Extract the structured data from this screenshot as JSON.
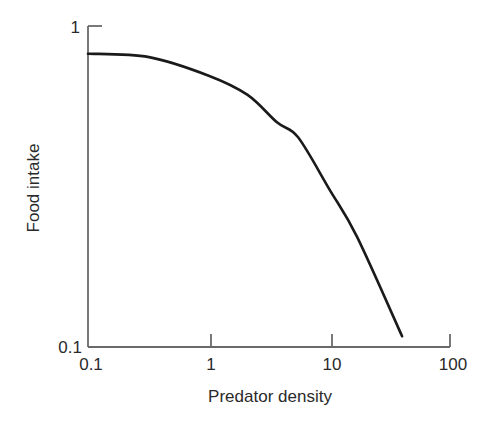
{
  "chart_data": {
    "type": "line",
    "title": "",
    "xlabel": "Predator density",
    "ylabel": "Food intake",
    "xscale": "log",
    "yscale": "log",
    "xlim": [
      0.1,
      100
    ],
    "ylim": [
      0.1,
      1
    ],
    "x_ticks": [
      "0.1",
      "1",
      "10",
      "100"
    ],
    "y_ticks": [
      "0.1",
      "1"
    ],
    "grid": false,
    "legend": null,
    "series": [
      {
        "name": "Food intake",
        "color": "#1a1a1a",
        "x": [
          0.1,
          0.32,
          1,
          2.1,
          3.7,
          5.5,
          10,
          17,
          40
        ],
        "y": [
          0.82,
          0.8,
          0.7,
          0.61,
          0.5,
          0.45,
          0.31,
          0.22,
          0.108
        ]
      }
    ]
  },
  "axes": {
    "x_title": "Predator density",
    "y_title": "Food intake",
    "x_tick_labels": [
      "0.1",
      "1",
      "10",
      "100"
    ],
    "y_tick_labels": [
      "0.1",
      "1"
    ]
  }
}
